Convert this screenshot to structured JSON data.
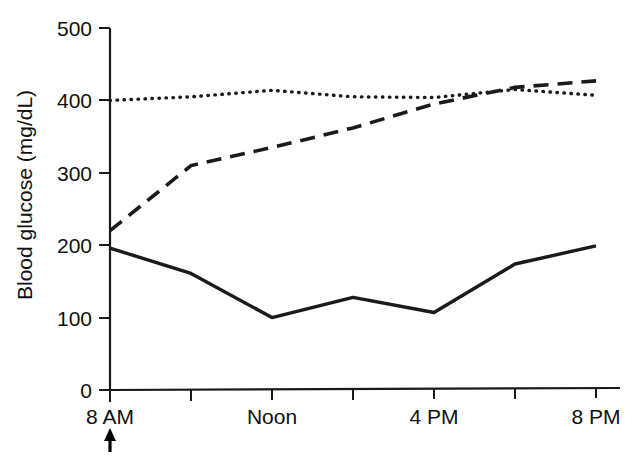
{
  "chart_data": {
    "type": "line",
    "title": "",
    "xlabel": "",
    "ylabel": "Blood glucose (mg/dL)",
    "ylim": [
      0,
      500
    ],
    "yticks": [
      0,
      100,
      200,
      300,
      400,
      500
    ],
    "ytick_labels": [
      "0",
      "100",
      "200",
      "300",
      "400",
      "500"
    ],
    "x": [
      "8 AM",
      "10 AM",
      "Noon",
      "2 PM",
      "4 PM",
      "6 PM",
      "8 PM"
    ],
    "xtick_labels": [
      "8 AM",
      "",
      "Noon",
      "",
      "4 PM",
      "",
      "8 PM"
    ],
    "grid": false,
    "legend": "none",
    "annotations": [
      {
        "name": "meal-arrow",
        "glyph": "up-arrow",
        "x_category": "8 AM",
        "description": "Upward arrow below the 8 AM tick"
      }
    ],
    "series": [
      {
        "name": "solid-line",
        "style": "solid",
        "color": "#1a1a1a",
        "values": [
          196,
          161,
          100,
          128,
          107,
          174,
          199
        ]
      },
      {
        "name": "dashed-line",
        "style": "dashed",
        "color": "#1a1a1a",
        "values": [
          220,
          310,
          335,
          362,
          395,
          418,
          427
        ]
      },
      {
        "name": "dotted-line",
        "style": "dotted",
        "color": "#1a1a1a",
        "values": [
          400,
          405,
          414,
          405,
          404,
          415,
          407
        ]
      }
    ]
  },
  "axes": {
    "y_title": "Blood glucose (mg/dL)",
    "y_ticks": [
      "500",
      "400",
      "300",
      "200",
      "100",
      "0"
    ],
    "x_ticks": [
      "8 AM",
      "Noon",
      "4 PM",
      "8 PM"
    ]
  }
}
